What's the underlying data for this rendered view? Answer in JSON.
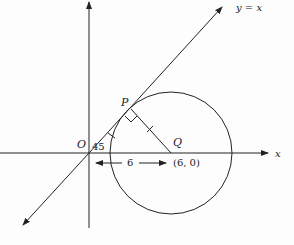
{
  "diagram": {
    "labels": {
      "line": "y = x",
      "x_axis": "x",
      "origin": "O",
      "angle": "45",
      "point_p": "P",
      "point_q": "Q",
      "q_coords": "(6, 0)",
      "distance": "6"
    },
    "colors": {
      "stroke": "#222222",
      "background": "#fdfdfd"
    },
    "geometry": {
      "origin": [
        89,
        153
      ],
      "circle_center": [
        171,
        153
      ],
      "circle_radius": 61,
      "tangent_point": [
        131,
        110
      ]
    }
  }
}
